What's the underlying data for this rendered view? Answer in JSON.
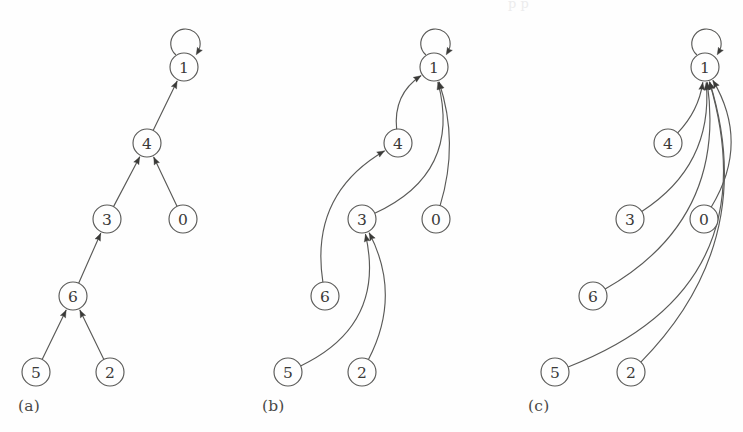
{
  "figure": {
    "background_color": "#fefefe",
    "stroke_color": "#5a5a58",
    "label_color": "#3a3a38",
    "bleed_text": "p          p"
  },
  "panels": [
    {
      "id": "a",
      "label": "(a)",
      "label_x": 18,
      "label_y": 397,
      "nodes": [
        {
          "id": "1",
          "label": "1",
          "cx": 184,
          "cy": 67,
          "r": 14
        },
        {
          "id": "4",
          "label": "4",
          "cx": 147,
          "cy": 143,
          "r": 14
        },
        {
          "id": "3",
          "label": "3",
          "cx": 107,
          "cy": 219,
          "r": 14
        },
        {
          "id": "0",
          "label": "0",
          "cx": 183,
          "cy": 219,
          "r": 14
        },
        {
          "id": "6",
          "label": "6",
          "cx": 73,
          "cy": 296,
          "r": 14
        },
        {
          "id": "5",
          "label": "5",
          "cx": 36,
          "cy": 372,
          "r": 14
        },
        {
          "id": "2",
          "label": "2",
          "cx": 110,
          "cy": 372,
          "r": 14
        }
      ],
      "edges": [
        {
          "from": "1",
          "to": "1",
          "kind": "self-loop"
        },
        {
          "from": "4",
          "to": "1",
          "kind": "straight"
        },
        {
          "from": "3",
          "to": "4",
          "kind": "straight"
        },
        {
          "from": "0",
          "to": "4",
          "kind": "straight"
        },
        {
          "from": "6",
          "to": "3",
          "kind": "straight"
        },
        {
          "from": "5",
          "to": "6",
          "kind": "straight"
        },
        {
          "from": "2",
          "to": "6",
          "kind": "straight"
        }
      ]
    },
    {
      "id": "b",
      "label": "(b)",
      "label_x": 262,
      "label_y": 397,
      "nodes": [
        {
          "id": "1",
          "label": "1",
          "cx": 434,
          "cy": 67,
          "r": 14
        },
        {
          "id": "4",
          "label": "4",
          "cx": 398,
          "cy": 143,
          "r": 14
        },
        {
          "id": "3",
          "label": "3",
          "cx": 362,
          "cy": 219,
          "r": 14
        },
        {
          "id": "0",
          "label": "0",
          "cx": 436,
          "cy": 219,
          "r": 14
        },
        {
          "id": "6",
          "label": "6",
          "cx": 325,
          "cy": 296,
          "r": 14
        },
        {
          "id": "5",
          "label": "5",
          "cx": 288,
          "cy": 372,
          "r": 14
        },
        {
          "id": "2",
          "label": "2",
          "cx": 362,
          "cy": 372,
          "r": 14
        }
      ],
      "edges": [
        {
          "from": "1",
          "to": "1",
          "kind": "self-loop"
        },
        {
          "from": "4",
          "to": "1",
          "kind": "curve"
        },
        {
          "from": "3",
          "to": "1",
          "kind": "curve"
        },
        {
          "from": "0",
          "to": "1",
          "kind": "curve"
        },
        {
          "from": "6",
          "to": "4",
          "kind": "curve"
        },
        {
          "from": "5",
          "to": "3",
          "kind": "curve"
        },
        {
          "from": "2",
          "to": "3",
          "kind": "curve"
        }
      ]
    },
    {
      "id": "c",
      "label": "(c)",
      "label_x": 528,
      "label_y": 397,
      "nodes": [
        {
          "id": "1",
          "label": "1",
          "cx": 705,
          "cy": 67,
          "r": 14
        },
        {
          "id": "4",
          "label": "4",
          "cx": 668,
          "cy": 143,
          "r": 14
        },
        {
          "id": "3",
          "label": "3",
          "cx": 630,
          "cy": 219,
          "r": 14
        },
        {
          "id": "0",
          "label": "0",
          "cx": 704,
          "cy": 219,
          "r": 14
        },
        {
          "id": "6",
          "label": "6",
          "cx": 593,
          "cy": 296,
          "r": 14
        },
        {
          "id": "5",
          "label": "5",
          "cx": 555,
          "cy": 372,
          "r": 14
        },
        {
          "id": "2",
          "label": "2",
          "cx": 631,
          "cy": 372,
          "r": 14
        }
      ],
      "edges": [
        {
          "from": "1",
          "to": "1",
          "kind": "self-loop"
        },
        {
          "from": "4",
          "to": "1",
          "kind": "curve"
        },
        {
          "from": "3",
          "to": "1",
          "kind": "curve"
        },
        {
          "from": "0",
          "to": "1",
          "kind": "curve"
        },
        {
          "from": "6",
          "to": "1",
          "kind": "curve"
        },
        {
          "from": "5",
          "to": "1",
          "kind": "curve"
        },
        {
          "from": "2",
          "to": "1",
          "kind": "curve"
        }
      ]
    }
  ]
}
